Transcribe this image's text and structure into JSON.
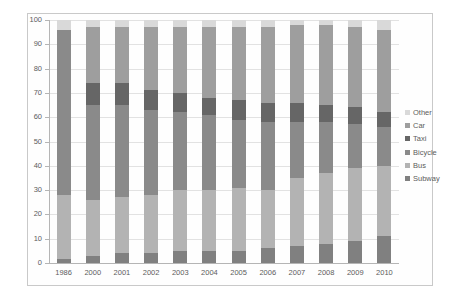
{
  "chart_data": {
    "type": "bar",
    "stacked": true,
    "title": "",
    "xlabel": "",
    "ylabel": "",
    "ylim": [
      0,
      100
    ],
    "ytick_step": 10,
    "yticks": [
      0,
      10,
      20,
      30,
      40,
      50,
      60,
      70,
      80,
      90,
      100
    ],
    "grid": true,
    "legend_position": "right",
    "categories": [
      "1986",
      "2000",
      "2001",
      "2002",
      "2003",
      "2004",
      "2005",
      "2006",
      "2007",
      "2008",
      "2009",
      "2010"
    ],
    "series": [
      {
        "name": "Subway",
        "color": "#808080",
        "values": [
          1.5,
          3.0,
          4.0,
          4.0,
          5.0,
          5.0,
          5.0,
          6.0,
          7.0,
          8.0,
          9.0,
          11.0
        ]
      },
      {
        "name": "Bus",
        "color": "#b3b3b3",
        "values": [
          26.5,
          23.0,
          23.0,
          24.0,
          25.0,
          25.0,
          26.0,
          24.0,
          28.0,
          29.0,
          30.0,
          29.0
        ]
      },
      {
        "name": "Bicycle",
        "color": "#8a8a8a",
        "values": [
          68.0,
          39.0,
          38.0,
          35.0,
          32.0,
          31.0,
          28.0,
          28.0,
          23.0,
          21.0,
          18.0,
          16.0
        ]
      },
      {
        "name": "Taxi",
        "color": "#666666",
        "values": [
          0.0,
          9.0,
          9.0,
          8.0,
          8.0,
          7.0,
          8.0,
          8.0,
          8.0,
          7.0,
          7.0,
          6.0
        ]
      },
      {
        "name": "Car",
        "color": "#9e9e9e",
        "values": [
          0.0,
          23.0,
          23.0,
          26.0,
          27.0,
          29.0,
          30.0,
          31.0,
          32.0,
          33.0,
          33.0,
          34.0
        ]
      },
      {
        "name": "Other",
        "color": "#d9d9d9",
        "values": [
          4.0,
          3.0,
          3.0,
          3.0,
          3.0,
          3.0,
          3.0,
          3.0,
          2.0,
          2.0,
          3.0,
          4.0
        ]
      }
    ],
    "legend_entries": [
      {
        "label": "Other",
        "color": "#d9d9d9"
      },
      {
        "label": "Car",
        "color": "#9e9e9e"
      },
      {
        "label": "Taxi",
        "color": "#666666"
      },
      {
        "label": "Bicycle",
        "color": "#8a8a8a"
      },
      {
        "label": "Bus",
        "color": "#b3b3b3"
      },
      {
        "label": "Subway",
        "color": "#808080"
      }
    ]
  }
}
